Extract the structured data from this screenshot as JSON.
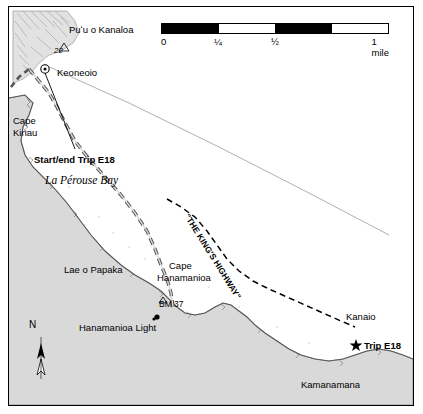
{
  "map": {
    "title_labels": {
      "puu_o_kanaloa": "Puʻu o Kanaloa",
      "elev_22": "22",
      "keoneoio": "Keoneoio",
      "cape_kinau_line1": "Cape",
      "cape_kinau_line2": "Kinau",
      "start_end": "Start/end Trip E18",
      "la_perouse_bay": "La Pérouse Bay",
      "kings_highway": "\"THE KING'S HIGHWAY\"",
      "lae_o_papaka": "Lae o Papaka",
      "cape_hanamanioa_line1": "Cape",
      "cape_hanamanioa_line2": "Hanamanioa",
      "bm37": "BM 37",
      "hanamanioa_light": "Hanamanioa Light",
      "kanaio": "Kanaio",
      "trip_e18": "Trip E18",
      "kamanamana": "Kamanamana",
      "north": "N"
    },
    "scale": {
      "ticks": [
        "0",
        "¼",
        "½",
        "1 mile"
      ],
      "segments": [
        "dark",
        "light",
        "dark",
        "light"
      ]
    },
    "colors": {
      "land": "#d8d8d8",
      "water": "#ffffff",
      "ink": "#000000",
      "lava_hatch": "#9a9a9a"
    }
  }
}
